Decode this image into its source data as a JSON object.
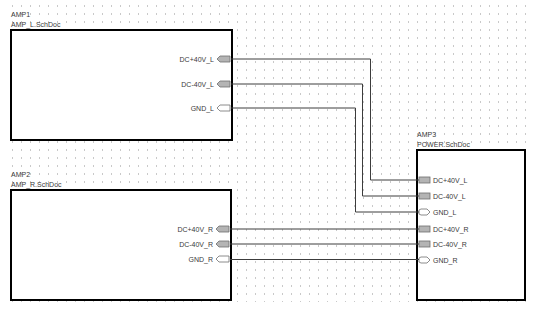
{
  "sheets": [
    {
      "designator": "AMP1",
      "file": "AMP_L.SchDoc",
      "pins": [
        {
          "name": "DC+40V_L",
          "type": "power"
        },
        {
          "name": "DC-40V_L",
          "type": "power"
        },
        {
          "name": "GND_L",
          "type": "passive"
        }
      ]
    },
    {
      "designator": "AMP2",
      "file": "AMP_R.SchDoc",
      "pins": [
        {
          "name": "DC+40V_R",
          "type": "power"
        },
        {
          "name": "DC-40V_R",
          "type": "power"
        },
        {
          "name": "GND_R",
          "type": "passive"
        }
      ]
    },
    {
      "designator": "AMP3",
      "file": "POWER.SchDoc",
      "pins": [
        {
          "name": "DC+40V_L",
          "type": "power"
        },
        {
          "name": "DC-40V_L",
          "type": "power"
        },
        {
          "name": "GND_L",
          "type": "passive"
        },
        {
          "name": "DC+40V_R",
          "type": "power"
        },
        {
          "name": "DC-40V_R",
          "type": "power"
        },
        {
          "name": "GND_R",
          "type": "passive"
        }
      ]
    }
  ],
  "wires": [
    {
      "from": "AMP1.DC+40V_L",
      "to": "AMP3.DC+40V_L"
    },
    {
      "from": "AMP1.DC-40V_L",
      "to": "AMP3.DC-40V_L"
    },
    {
      "from": "AMP1.GND_L",
      "to": "AMP3.GND_L"
    },
    {
      "from": "AMP2.DC+40V_R",
      "to": "AMP3.DC+40V_R"
    },
    {
      "from": "AMP2.DC-40V_R",
      "to": "AMP3.DC-40V_R"
    },
    {
      "from": "AMP2.GND_R",
      "to": "AMP3.GND_R"
    }
  ],
  "colors": {
    "power_pin_fill": "#b4b4b4",
    "passive_pin_fill": "#ffffff",
    "wire": "#3c3c3c",
    "sheet_border": "#000000",
    "grid_dot": "#c9c9c9"
  }
}
